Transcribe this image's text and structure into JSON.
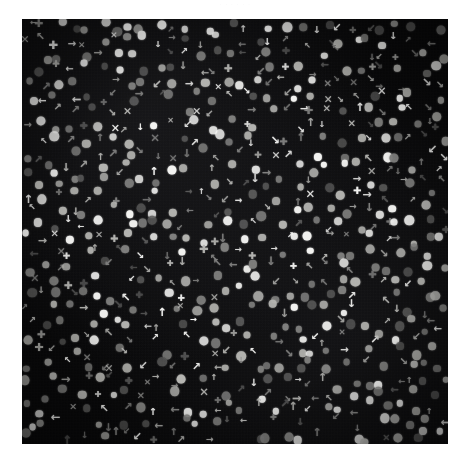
{
  "caption_remnant": "·  ·                       ·   ·                  ·        ·",
  "figure": {
    "background_color": "#050506",
    "canvas": {
      "x": 22,
      "y": 19,
      "width": 426,
      "height": 425
    },
    "element_palette": {
      "bright": "#f4f4f2",
      "mid": "#b2b2ae",
      "dim": "#7a7a78",
      "faint": "#4e4e4d"
    },
    "glyph_legend": [
      {
        "name": "arrow-up-icon",
        "char": "↑"
      },
      {
        "name": "arrow-down-icon",
        "char": "↓"
      },
      {
        "name": "arrow-left-icon",
        "char": "←"
      },
      {
        "name": "arrow-right-icon",
        "char": "→"
      },
      {
        "name": "arrow-up-left-icon",
        "char": "↖"
      },
      {
        "name": "arrow-up-right-icon",
        "char": "↗"
      },
      {
        "name": "arrow-down-left-icon",
        "char": "↙"
      },
      {
        "name": "arrow-down-right-icon",
        "char": "↘"
      },
      {
        "name": "plus-icon",
        "char": "✚"
      },
      {
        "name": "cross-icon",
        "char": "✕"
      },
      {
        "name": "disc-icon",
        "char": "●"
      }
    ],
    "counts": {
      "dots": 430,
      "glyphs": 330,
      "total": 760
    }
  },
  "chart_data": {
    "type": "scatter",
    "subtitle": "",
    "xlabel": "",
    "ylabel": "",
    "xlim": [
      0,
      100
    ],
    "ylim": [
      0,
      100
    ],
    "grid": false,
    "legend_position": "none",
    "marker_kinds": [
      "dot",
      "arrow-up",
      "arrow-down",
      "arrow-left",
      "arrow-right",
      "arrow-up-left",
      "arrow-up-right",
      "arrow-down-left",
      "arrow-down-right",
      "plus",
      "cross"
    ],
    "brightness_levels": [
      "bright",
      "mid",
      "dim",
      "faint"
    ],
    "generator": {
      "grid_cols": 30,
      "grid_rows": 30,
      "jitter_pct": 42,
      "fill_probability": 0.86,
      "dot_share": 0.56,
      "seed": 20240917
    }
  }
}
